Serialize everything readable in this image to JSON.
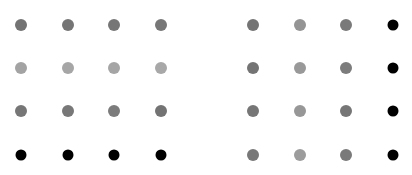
{
  "figure": {
    "title": "",
    "background_color": "#ffffff",
    "width": 412,
    "height": 175
  },
  "chart_data": {
    "type": "heatmap",
    "title": "",
    "xlabel": "",
    "ylabel": "",
    "grid": false,
    "legend": "none",
    "layout": {
      "rows": 4,
      "columns": 8,
      "groups": 2,
      "columns_per_group": 4,
      "group_gap_px": 45,
      "column_centers_px": [
        21,
        68,
        114,
        161,
        253,
        300,
        346,
        393
      ],
      "row_centers_px": [
        25,
        68,
        111,
        155
      ],
      "dot_diameter_px": 12,
      "dot_diameter_dark_px": 11
    },
    "categories": [
      "c1",
      "c2",
      "c3",
      "c4",
      "c5",
      "c6",
      "c7",
      "c8"
    ],
    "row_labels": [
      "r1",
      "r2",
      "r3",
      "r4"
    ],
    "colormap": "grayscale",
    "value_range": [
      0,
      1
    ],
    "cells": [
      {
        "row": 0,
        "col": 0,
        "cx": 21,
        "cy": 25,
        "value": 0.55,
        "color": "#737373",
        "size": 12
      },
      {
        "row": 0,
        "col": 1,
        "cx": 68,
        "cy": 25,
        "value": 0.55,
        "color": "#757575",
        "size": 12
      },
      {
        "row": 0,
        "col": 2,
        "cx": 114,
        "cy": 25,
        "value": 0.54,
        "color": "#767676",
        "size": 12
      },
      {
        "row": 0,
        "col": 3,
        "cx": 161,
        "cy": 25,
        "value": 0.54,
        "color": "#777777",
        "size": 12
      },
      {
        "row": 0,
        "col": 4,
        "cx": 253,
        "cy": 25,
        "value": 0.55,
        "color": "#747474",
        "size": 12
      },
      {
        "row": 0,
        "col": 5,
        "cx": 300,
        "cy": 25,
        "value": 0.42,
        "color": "#949494",
        "size": 12
      },
      {
        "row": 0,
        "col": 6,
        "cx": 346,
        "cy": 25,
        "value": 0.53,
        "color": "#7a7a7a",
        "size": 12
      },
      {
        "row": 0,
        "col": 7,
        "cx": 393,
        "cy": 25,
        "value": 1.0,
        "color": "#000000",
        "size": 11
      },
      {
        "row": 1,
        "col": 0,
        "cx": 21,
        "cy": 68,
        "value": 0.35,
        "color": "#a3a3a3",
        "size": 12
      },
      {
        "row": 1,
        "col": 1,
        "cx": 68,
        "cy": 68,
        "value": 0.34,
        "color": "#a6a6a6",
        "size": 12
      },
      {
        "row": 1,
        "col": 2,
        "cx": 114,
        "cy": 68,
        "value": 0.34,
        "color": "#a5a5a5",
        "size": 12
      },
      {
        "row": 1,
        "col": 3,
        "cx": 161,
        "cy": 68,
        "value": 0.33,
        "color": "#a8a8a8",
        "size": 12
      },
      {
        "row": 1,
        "col": 4,
        "cx": 253,
        "cy": 68,
        "value": 0.55,
        "color": "#747474",
        "size": 12
      },
      {
        "row": 1,
        "col": 5,
        "cx": 300,
        "cy": 68,
        "value": 0.4,
        "color": "#999999",
        "size": 12
      },
      {
        "row": 1,
        "col": 6,
        "cx": 346,
        "cy": 68,
        "value": 0.52,
        "color": "#7c7c7c",
        "size": 12
      },
      {
        "row": 1,
        "col": 7,
        "cx": 393,
        "cy": 68,
        "value": 1.0,
        "color": "#000000",
        "size": 11
      },
      {
        "row": 2,
        "col": 0,
        "cx": 21,
        "cy": 111,
        "value": 0.54,
        "color": "#767676",
        "size": 12
      },
      {
        "row": 2,
        "col": 1,
        "cx": 68,
        "cy": 111,
        "value": 0.53,
        "color": "#787878",
        "size": 12
      },
      {
        "row": 2,
        "col": 2,
        "cx": 114,
        "cy": 111,
        "value": 0.52,
        "color": "#7c7c7c",
        "size": 12
      },
      {
        "row": 2,
        "col": 3,
        "cx": 161,
        "cy": 111,
        "value": 0.55,
        "color": "#737373",
        "size": 12
      },
      {
        "row": 2,
        "col": 4,
        "cx": 253,
        "cy": 111,
        "value": 0.54,
        "color": "#767676",
        "size": 12
      },
      {
        "row": 2,
        "col": 5,
        "cx": 300,
        "cy": 111,
        "value": 0.41,
        "color": "#979797",
        "size": 12
      },
      {
        "row": 2,
        "col": 6,
        "cx": 346,
        "cy": 111,
        "value": 0.54,
        "color": "#767676",
        "size": 12
      },
      {
        "row": 2,
        "col": 7,
        "cx": 393,
        "cy": 111,
        "value": 1.0,
        "color": "#000000",
        "size": 11
      },
      {
        "row": 3,
        "col": 0,
        "cx": 21,
        "cy": 155,
        "value": 1.0,
        "color": "#000000",
        "size": 11
      },
      {
        "row": 3,
        "col": 1,
        "cx": 68,
        "cy": 155,
        "value": 1.0,
        "color": "#000000",
        "size": 11
      },
      {
        "row": 3,
        "col": 2,
        "cx": 114,
        "cy": 155,
        "value": 1.0,
        "color": "#000000",
        "size": 11
      },
      {
        "row": 3,
        "col": 3,
        "cx": 161,
        "cy": 155,
        "value": 1.0,
        "color": "#000000",
        "size": 11
      },
      {
        "row": 3,
        "col": 4,
        "cx": 253,
        "cy": 155,
        "value": 0.53,
        "color": "#787878",
        "size": 12
      },
      {
        "row": 3,
        "col": 5,
        "cx": 300,
        "cy": 155,
        "value": 0.39,
        "color": "#9c9c9c",
        "size": 12
      },
      {
        "row": 3,
        "col": 6,
        "cx": 346,
        "cy": 155,
        "value": 0.53,
        "color": "#7a7a7a",
        "size": 12
      },
      {
        "row": 3,
        "col": 7,
        "cx": 393,
        "cy": 155,
        "value": 1.0,
        "color": "#000000",
        "size": 11
      }
    ]
  }
}
